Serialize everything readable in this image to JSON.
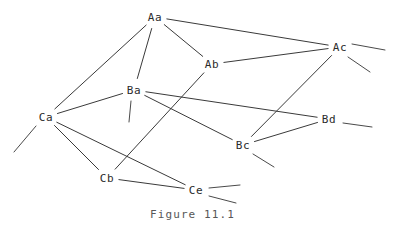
{
  "figure": {
    "caption": "Figure 11.1",
    "caption_x": 150,
    "caption_y": 208,
    "width": 401,
    "height": 238,
    "background_color": "#ffffff",
    "line_color": "#3a3a3a",
    "text_color": "#2b2b2b",
    "caption_color": "#575757"
  },
  "chart_data": {
    "type": "diagram",
    "title": "Figure 11.1",
    "nodes": [
      {
        "id": "Aa",
        "label": "Aa",
        "x": 155,
        "y": 17
      },
      {
        "id": "Ab",
        "label": "Ab",
        "x": 212,
        "y": 64
      },
      {
        "id": "Ac",
        "label": "Ac",
        "x": 340,
        "y": 47
      },
      {
        "id": "Ba",
        "label": "Ba",
        "x": 134,
        "y": 90
      },
      {
        "id": "Bc",
        "label": "Bc",
        "x": 243,
        "y": 145
      },
      {
        "id": "Bd",
        "label": "Bd",
        "x": 329,
        "y": 119
      },
      {
        "id": "Ca",
        "label": "Ca",
        "x": 46,
        "y": 117
      },
      {
        "id": "Cb",
        "label": "Cb",
        "x": 107,
        "y": 178
      },
      {
        "id": "Ce",
        "label": "Ce",
        "x": 196,
        "y": 190
      }
    ],
    "edges": [
      {
        "from": "Aa",
        "to": "Ab"
      },
      {
        "from": "Aa",
        "to": "Ac"
      },
      {
        "from": "Aa",
        "to": "Ba"
      },
      {
        "from": "Aa",
        "to": "Ca"
      },
      {
        "from": "Ab",
        "to": "Ac"
      },
      {
        "from": "Ab",
        "to": "Cb"
      },
      {
        "from": "Ac",
        "to": "Bc"
      },
      {
        "from": "Ba",
        "to": "Ca"
      },
      {
        "from": "Ba",
        "to": "Bc"
      },
      {
        "from": "Ba",
        "to": "Bd"
      },
      {
        "from": "Bc",
        "to": "Bd"
      },
      {
        "from": "Ca",
        "to": "Cb"
      },
      {
        "from": "Ca",
        "to": "Ce"
      },
      {
        "from": "Cb",
        "to": "Ce"
      }
    ],
    "stubs": [
      {
        "from": "Ac",
        "x1": 352,
        "y1": 44,
        "x2": 385,
        "y2": 50
      },
      {
        "from": "Ac",
        "x1": 348,
        "y1": 57,
        "x2": 370,
        "y2": 72
      },
      {
        "from": "Bd",
        "x1": 343,
        "y1": 123,
        "x2": 372,
        "y2": 127
      },
      {
        "from": "Bc",
        "x1": 253,
        "y1": 154,
        "x2": 274,
        "y2": 167
      },
      {
        "from": "Ba",
        "x1": 131,
        "y1": 101,
        "x2": 129,
        "y2": 122
      },
      {
        "from": "Ca",
        "x1": 36,
        "y1": 126,
        "x2": 14,
        "y2": 152
      },
      {
        "from": "Ce",
        "x1": 209,
        "y1": 188,
        "x2": 240,
        "y2": 185
      },
      {
        "from": "Ce",
        "x1": 209,
        "y1": 196,
        "x2": 236,
        "y2": 203
      }
    ]
  }
}
